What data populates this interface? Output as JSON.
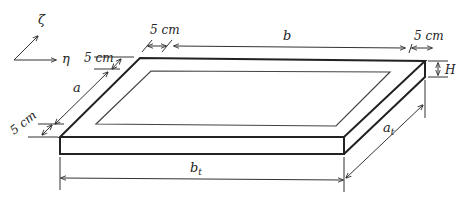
{
  "diagram": {
    "axes": {
      "vertical_label": "ζ",
      "horizontal_label": "η"
    },
    "labels": {
      "border_top": "5 cm",
      "border_right": "5 cm",
      "border_left_top": "5 cm",
      "border_left_bottom": "5 cm",
      "inner_length": "b",
      "inner_width": "a",
      "thickness": "H",
      "total_length": "b",
      "total_length_sub": "t",
      "total_width": "a",
      "total_width_sub": "t"
    },
    "colors": {
      "line": "#222222",
      "background": "#ffffff"
    }
  }
}
